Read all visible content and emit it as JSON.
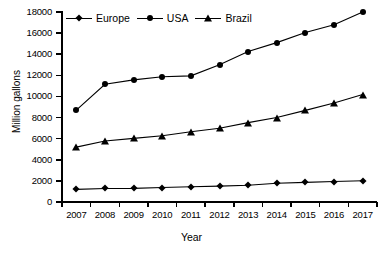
{
  "chart_data": {
    "type": "line",
    "title": "",
    "xlabel": "Year",
    "ylabel": "Million gallons",
    "categories": [
      "2007",
      "2008",
      "2009",
      "2010",
      "2011",
      "2012",
      "2013",
      "2014",
      "2015",
      "2016",
      "2017"
    ],
    "ylim": [
      0,
      18000
    ],
    "yticks": [
      0,
      2000,
      4000,
      6000,
      8000,
      10000,
      12000,
      14000,
      16000,
      18000
    ],
    "grid": false,
    "legend_position": "top-inside",
    "series": [
      {
        "name": "Europe",
        "marker": "diamond",
        "color": "#000000",
        "values": [
          1200,
          1280,
          1290,
          1370,
          1450,
          1500,
          1580,
          1770,
          1860,
          1940,
          2010
        ]
      },
      {
        "name": "USA",
        "marker": "circle",
        "color": "#000000",
        "values": [
          8700,
          11150,
          11570,
          11870,
          11950,
          13000,
          14250,
          15100,
          16050,
          16800,
          18000
        ]
      },
      {
        "name": "Brazil",
        "marker": "triangle",
        "color": "#000000",
        "values": [
          5200,
          5780,
          6030,
          6280,
          6650,
          6980,
          7520,
          8000,
          8680,
          9380,
          10180
        ]
      }
    ]
  }
}
